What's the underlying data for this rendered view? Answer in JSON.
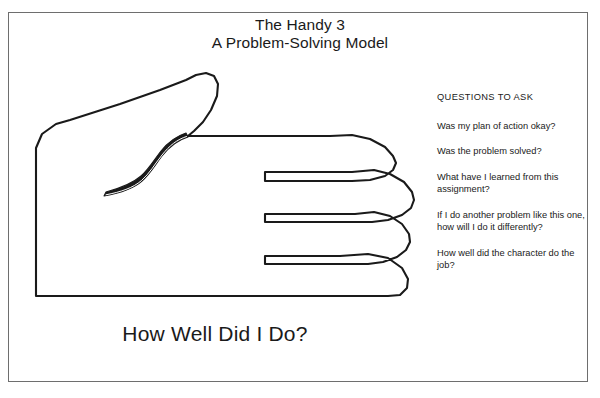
{
  "poster": {
    "title_line_1": "The Handy 3",
    "title_line_2": "A Problem-Solving Model",
    "caption": "How Well Did I Do?",
    "background_color": "#ffffff",
    "border_color": "#6e6e6e",
    "ink_color": "#1a1a1a"
  },
  "diagram": {
    "name": "open-hand-outline",
    "stroke_color": "#1a1a1a",
    "fill_color": "#ffffff"
  },
  "questions": {
    "heading": "QUESTIONS TO ASK",
    "items": [
      "Was my plan of action okay?",
      "Was the problem solved?",
      "What have I learned from this assignment?",
      "If I do another problem like this one, how will I do it differently?",
      "How well did the character do the job?"
    ]
  }
}
